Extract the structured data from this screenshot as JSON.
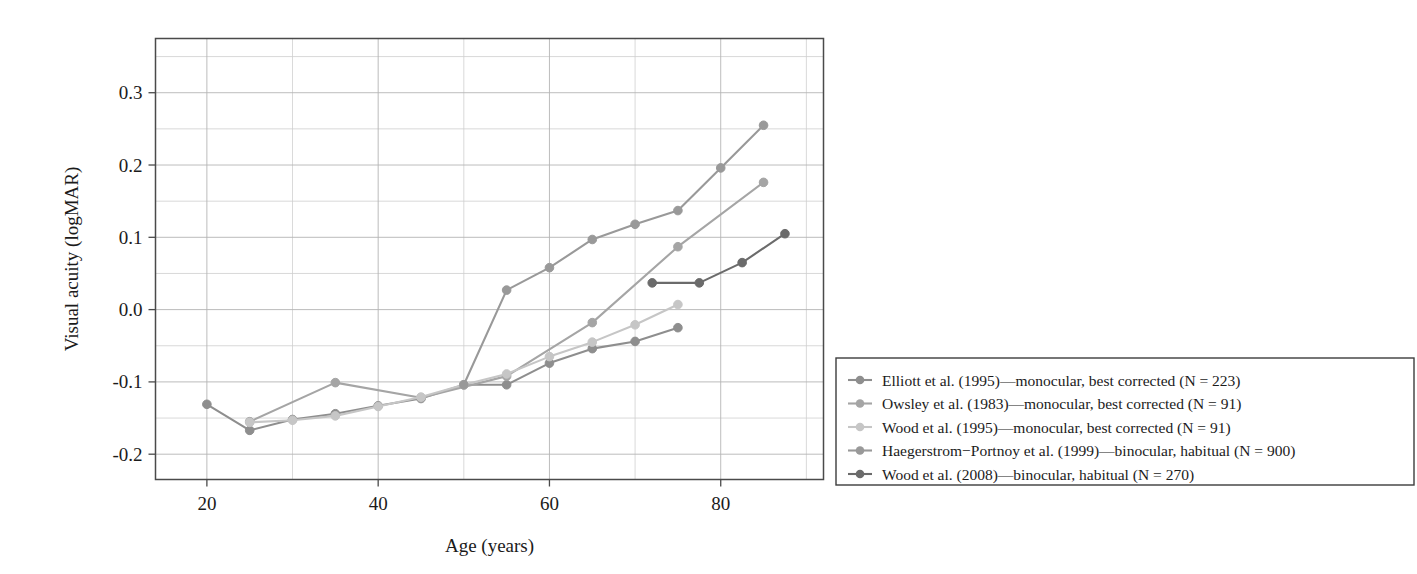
{
  "figure": {
    "background": "#ffffff",
    "axis_color": "#4a4a4a",
    "grid_color": "#cfcfcf"
  },
  "chart_data": {
    "type": "line",
    "title": "",
    "xlabel": "Age (years)",
    "ylabel": "Visual acuity (logMAR)",
    "xlim": [
      14,
      92
    ],
    "ylim": [
      -0.235,
      0.375
    ],
    "xticks": [
      20,
      40,
      60,
      80
    ],
    "xtick_labels": [
      "20",
      "40",
      "60",
      "80"
    ],
    "x_minor_step": 10,
    "yticks": [
      -0.2,
      -0.1,
      0.0,
      0.1,
      0.2,
      0.3
    ],
    "ytick_labels": [
      "-0.2",
      "-0.1",
      "0.0",
      "0.1",
      "0.2",
      "0.3"
    ],
    "y_minor_step": 0.05,
    "grid": true,
    "legend_position": "right-outside",
    "series": [
      {
        "name": "Elliott et al. (1995)—monocular, best corrected (N = 223)",
        "color": "#8e8e8e",
        "x": [
          20,
          25,
          30,
          35,
          40,
          45,
          50,
          55,
          60,
          65,
          70,
          75
        ],
        "y": [
          -0.131,
          -0.167,
          -0.152,
          -0.144,
          -0.133,
          -0.123,
          -0.104,
          -0.104,
          -0.074,
          -0.054,
          -0.044,
          -0.025
        ]
      },
      {
        "name": "Owsley et al. (1983)—monocular, best corrected (N = 91)",
        "color": "#a5a5a5",
        "x": [
          25,
          35,
          45,
          55,
          65,
          75,
          85
        ],
        "y": [
          -0.155,
          -0.101,
          -0.122,
          -0.092,
          -0.018,
          0.087,
          0.176
        ]
      },
      {
        "name": "Wood et al. (1995)—monocular, best corrected (N = 91)",
        "color": "#c6c6c6",
        "x": [
          25,
          30,
          35,
          40,
          45,
          50,
          55,
          60,
          65,
          70,
          75
        ],
        "y": [
          -0.156,
          -0.153,
          -0.147,
          -0.134,
          -0.121,
          -0.104,
          -0.089,
          -0.065,
          -0.045,
          -0.021,
          0.007
        ]
      },
      {
        "name": "Haegerstrom−Portnoy et al. (1999)—binocular, habitual (N = 900)",
        "color": "#999999",
        "x": [
          50,
          55,
          60,
          65,
          70,
          75,
          80,
          85
        ],
        "y": [
          -0.104,
          0.027,
          0.058,
          0.097,
          0.118,
          0.137,
          0.196,
          0.255
        ]
      },
      {
        "name": "Wood et al. (2008)—binocular, habitual (N = 270)",
        "color": "#6b6b6b",
        "x": [
          72,
          77.5,
          82.5,
          87.5
        ],
        "y": [
          0.037,
          0.037,
          0.065,
          0.105
        ]
      }
    ]
  },
  "legend": {
    "items": [
      {
        "label": "Elliott et al. (1995)—monocular, best corrected (N = 223)",
        "color": "#8e8e8e"
      },
      {
        "label": "Owsley et al. (1983)—monocular, best corrected (N = 91)",
        "color": "#a5a5a5"
      },
      {
        "label": "Wood et al. (1995)—monocular, best corrected (N = 91)",
        "color": "#c6c6c6"
      },
      {
        "label": "Haegerstrom−Portnoy et al. (1999)—binocular, habitual (N = 900)",
        "color": "#999999"
      },
      {
        "label": "Wood et al. (2008)—binocular, habitual (N = 270)",
        "color": "#6b6b6b"
      }
    ]
  }
}
